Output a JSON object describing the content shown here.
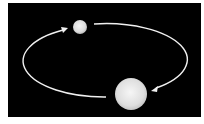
{
  "diagram": {
    "title": "",
    "background_color": "#000000",
    "frame_color": "#ffffff",
    "orbit": {
      "stroke_color": "#f2f2f2",
      "direction": "clockwise"
    },
    "bodies": [
      {
        "name": "small-body",
        "color": "#e8e8e8"
      },
      {
        "name": "large-body",
        "color": "#e4e4e4"
      }
    ]
  }
}
